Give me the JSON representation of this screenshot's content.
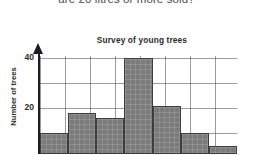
{
  "question": {
    "text": "are 20 litres or more sold?"
  },
  "chart_data": {
    "type": "bar",
    "title": "Survey of young trees",
    "xlabel": "",
    "ylabel": "Number of trees",
    "ylim": [
      0,
      44
    ],
    "yticks": [
      20,
      40
    ],
    "ytick_labels": [
      "20",
      "40"
    ],
    "grid": true,
    "legend": "none",
    "categories": [
      "1",
      "2",
      "3",
      "4",
      "5",
      "6",
      "7"
    ],
    "values": [
      10,
      18,
      16,
      40,
      21,
      10,
      5
    ],
    "bar_color": "#7b7b7b",
    "bar_edge_color": "#3c3c3c"
  },
  "colors": {
    "background": "#ffffff",
    "axis": "#1d1d1d",
    "text": "#2b2b2b",
    "question_text": "#4a4a4a",
    "minor_grid": "#7878964d",
    "major_grid": "#4646648c"
  }
}
